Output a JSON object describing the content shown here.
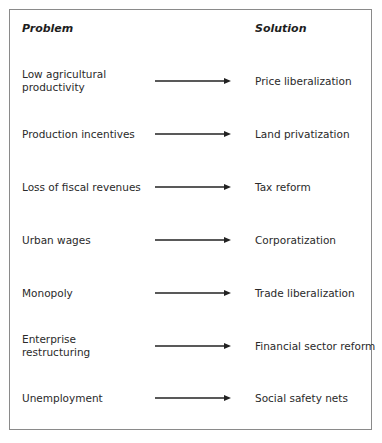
{
  "headers": {
    "problem": "Problem",
    "solution": "Solution"
  },
  "rows": [
    {
      "problem": "Low agricultural productivity",
      "solution": "Price liberalization",
      "y": 81
    },
    {
      "problem": "Production incentives",
      "solution": "Land privatization",
      "y": 134
    },
    {
      "problem": "Loss of fiscal revenues",
      "solution": "Tax reform",
      "y": 187
    },
    {
      "problem": "Urban wages",
      "solution": "Corporatization",
      "y": 240
    },
    {
      "problem": "Monopoly",
      "solution": "Trade liberalization",
      "y": 293
    },
    {
      "problem": "Enterprise restructuring",
      "solution": "Financial sector reform",
      "y": 346
    },
    {
      "problem": "Unemployment",
      "solution": "Social safety nets",
      "y": 398
    }
  ],
  "colors": {
    "arrow": "#222222",
    "border": "#8a8a8a",
    "text": "#2a2a2a"
  }
}
